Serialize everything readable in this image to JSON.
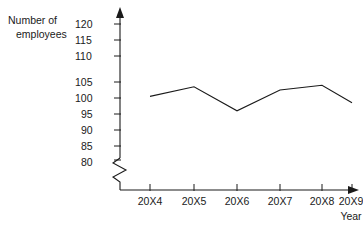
{
  "chart_data": {
    "type": "line",
    "title": "",
    "subtitle": "",
    "xlabel": "Year",
    "ylabel": "Number of employees",
    "ylabel_line1": "Number of",
    "ylabel_line2": "employees",
    "categories": [
      "20X4",
      "20X5",
      "20X6",
      "20X7",
      "20X8",
      "20X9"
    ],
    "values": [
      100.5,
      103.5,
      96,
      102.5,
      104,
      98.5
    ],
    "series": [
      {
        "name": "Number of employees",
        "values": [
          100.5,
          103.5,
          96,
          102.5,
          104,
          98.5
        ]
      }
    ],
    "ylim": [
      80,
      120
    ],
    "ytick_labels": [
      "120",
      "115",
      "110",
      "105",
      "100",
      "95",
      "90",
      "85",
      "80"
    ],
    "ytick_values": [
      120,
      115,
      110,
      105,
      100,
      95,
      90,
      85,
      80
    ],
    "ytick_step": 5,
    "xtick_labels": [
      "20X4",
      "20X5",
      "20X6",
      "20X7",
      "20X8",
      "20X9"
    ],
    "grid": false,
    "legend": false,
    "legend_position": "none",
    "axis_break": true,
    "axis_break_note": "zigzag break on y-axis below 80",
    "line_color": "#1a1a1a",
    "axis_color": "#1a1a1a",
    "background_color": "#ffffff",
    "annotations": []
  }
}
